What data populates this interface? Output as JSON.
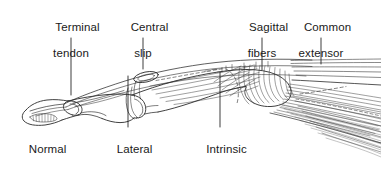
{
  "figure": {
    "type": "anatomical-line-drawing",
    "background_color": "#ffffff",
    "ink_color": "#1a1a1a",
    "width": 381,
    "height": 170
  },
  "labels": [
    {
      "id": "terminal-tendon",
      "line1": "Terminal",
      "line2": "tendon",
      "text_x": 71,
      "text_y": 8,
      "leader": {
        "x1": 71,
        "y1": 38,
        "x2": 71,
        "y2": 95
      },
      "position": "above-left"
    },
    {
      "id": "central-slip",
      "line1": "Central",
      "line2": "slip",
      "text_x": 143,
      "text_y": 8,
      "leader": {
        "x1": 143,
        "y1": 38,
        "x2": 143,
        "y2": 69
      },
      "position": "above-center"
    },
    {
      "id": "sagittal-fibers",
      "line1": "Sagittal",
      "line2": "fibers",
      "text_x": 262,
      "text_y": 8,
      "leader": {
        "x1": 262,
        "y1": 38,
        "x2": 262,
        "y2": 70
      },
      "position": "above-right"
    },
    {
      "id": "common-extensor",
      "line1": "Common",
      "line2": "extensor",
      "text_x": 321,
      "text_y": 8,
      "leader": {
        "x1": 321,
        "y1": 38,
        "x2": 321,
        "y2": 64
      },
      "position": "above-far-right"
    },
    {
      "id": "normal",
      "line1": "Normal",
      "line2": "",
      "text_x": 41,
      "text_y": 130,
      "leader": null,
      "position": "below-left"
    },
    {
      "id": "lateral-band",
      "line1": "Lateral",
      "line2": "band",
      "text_x": 128,
      "text_y": 130,
      "leader": {
        "x1": 128,
        "y1": 76,
        "x2": 128,
        "y2": 127
      },
      "position": "below-center"
    },
    {
      "id": "intrinsic-tendon",
      "line1": "Intrinsic",
      "line2": "tendon",
      "text_x": 220,
      "text_y": 130,
      "leader": {
        "x1": 220,
        "y1": 72,
        "x2": 220,
        "y2": 127
      },
      "position": "below-right"
    }
  ]
}
